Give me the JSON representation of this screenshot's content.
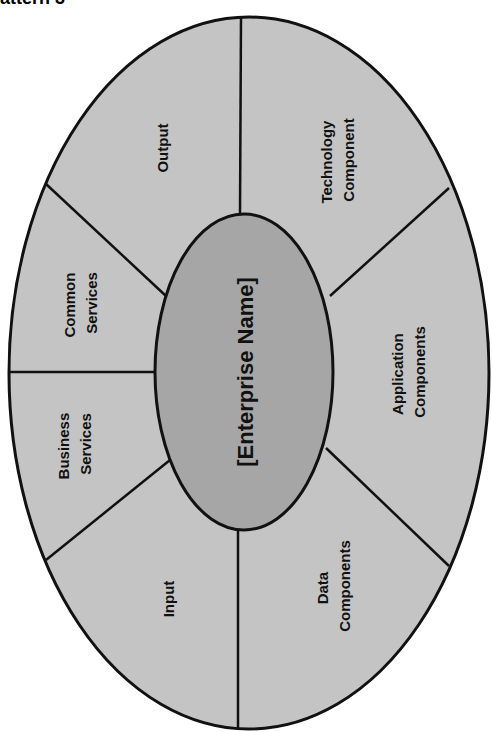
{
  "heading": "attern 3",
  "diagram": {
    "center": {
      "label": "[Enterprise Name]"
    },
    "segments": [
      {
        "id": "output",
        "lines": [
          "Output"
        ]
      },
      {
        "id": "technology-component",
        "lines": [
          "Technology",
          "Component"
        ]
      },
      {
        "id": "application-components",
        "lines": [
          "Application",
          "Components"
        ]
      },
      {
        "id": "data-components",
        "lines": [
          "Data",
          "Components"
        ]
      },
      {
        "id": "input",
        "lines": [
          "Input"
        ]
      },
      {
        "id": "business-services",
        "lines": [
          "Business",
          "Services"
        ]
      },
      {
        "id": "common-services",
        "lines": [
          "Common",
          "Services"
        ]
      }
    ],
    "colors": {
      "outer_fill": "#c4c4c4",
      "inner_fill": "#a6a6a6",
      "stroke": "#111111",
      "text": "#111111"
    }
  }
}
